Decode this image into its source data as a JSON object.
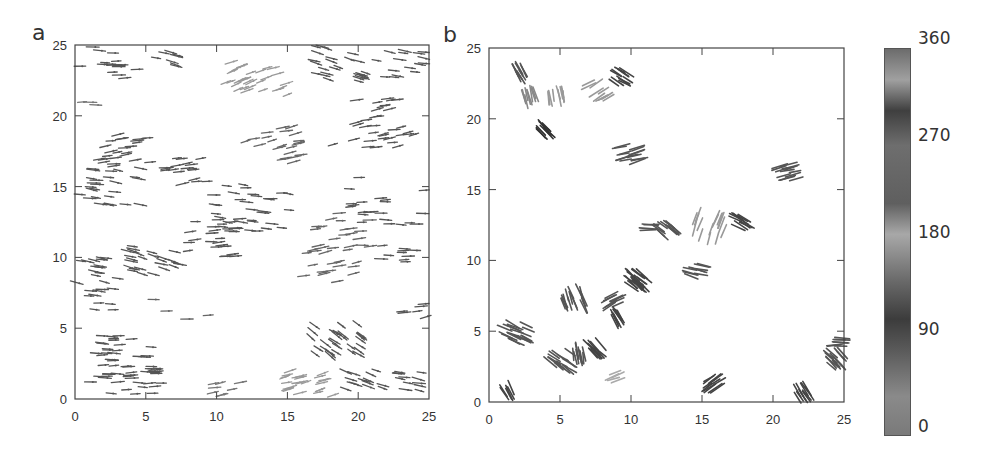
{
  "figure": {
    "panels": [
      {
        "label": "a"
      },
      {
        "label": "b"
      }
    ],
    "colorbar": {
      "ticks": [
        "360",
        "270",
        "180",
        "90",
        "0"
      ],
      "tick_values": [
        360,
        270,
        180,
        90,
        0
      ],
      "gradient_stops": [
        {
          "pos": 0.0,
          "color": "#7a7a7a"
        },
        {
          "pos": 0.1,
          "color": "#8a8a8a"
        },
        {
          "pos": 0.22,
          "color": "#5a5a5a"
        },
        {
          "pos": 0.3,
          "color": "#3c3c3c"
        },
        {
          "pos": 0.4,
          "color": "#6a6a6a"
        },
        {
          "pos": 0.52,
          "color": "#a8a8a8"
        },
        {
          "pos": 0.6,
          "color": "#5f5f5f"
        },
        {
          "pos": 0.75,
          "color": "#6e6e6e"
        },
        {
          "pos": 0.84,
          "color": "#3f3f3f"
        },
        {
          "pos": 0.92,
          "color": "#a0a0a0"
        },
        {
          "pos": 1.0,
          "color": "#6c6c6c"
        }
      ]
    }
  },
  "chart_data": [
    {
      "type": "scatter",
      "title": "a",
      "subtype": "vector field (particle orientations, short arrows)",
      "xlabel": "",
      "ylabel": "",
      "xlim": [
        0,
        25
      ],
      "ylim": [
        0,
        25
      ],
      "xticks": [
        "0",
        "5",
        "10",
        "15",
        "20",
        "25"
      ],
      "yticks": [
        "0",
        "5",
        "10",
        "15",
        "20",
        "25"
      ],
      "grid": false,
      "description": "Dense, mostly horizontal arrows spread across domain; light-grey tilted cluster near (13,23) and (17,1); tilted dark cluster near (18,4).",
      "clusters": [
        {
          "x": 1.5,
          "y": 24.2,
          "n": 6,
          "angle": 0,
          "spread": 1.2,
          "color": "#555"
        },
        {
          "x": 3.2,
          "y": 23.2,
          "n": 10,
          "angle": 0,
          "spread": 1.3,
          "color": "#555"
        },
        {
          "x": 6.5,
          "y": 24.0,
          "n": 8,
          "angle": -15,
          "spread": 1.0,
          "color": "#555"
        },
        {
          "x": 12.8,
          "y": 22.8,
          "n": 30,
          "angle": 20,
          "spread": 2.2,
          "color": "#999"
        },
        {
          "x": 18.5,
          "y": 23.8,
          "n": 26,
          "angle": -18,
          "spread": 2.3,
          "color": "#555"
        },
        {
          "x": 23.0,
          "y": 23.8,
          "n": 16,
          "angle": -10,
          "spread": 1.8,
          "color": "#555"
        },
        {
          "x": 1.0,
          "y": 21.0,
          "n": 3,
          "angle": 0,
          "spread": 0.5,
          "color": "#777"
        },
        {
          "x": 21.0,
          "y": 19.5,
          "n": 34,
          "angle": 10,
          "spread": 3.0,
          "color": "#555"
        },
        {
          "x": 14.0,
          "y": 18.0,
          "n": 22,
          "angle": 12,
          "spread": 2.2,
          "color": "#666"
        },
        {
          "x": 3.5,
          "y": 17.5,
          "n": 24,
          "angle": 8,
          "spread": 2.0,
          "color": "#555"
        },
        {
          "x": 8.0,
          "y": 16.0,
          "n": 18,
          "angle": 8,
          "spread": 1.7,
          "color": "#555"
        },
        {
          "x": 2.5,
          "y": 15.0,
          "n": 26,
          "angle": -8,
          "spread": 2.2,
          "color": "#555"
        },
        {
          "x": 12.5,
          "y": 13.5,
          "n": 36,
          "angle": -5,
          "spread": 2.8,
          "color": "#555"
        },
        {
          "x": 22.0,
          "y": 14.0,
          "n": 22,
          "angle": 0,
          "spread": 3.0,
          "color": "#555"
        },
        {
          "x": 19.0,
          "y": 12.0,
          "n": 18,
          "angle": 5,
          "spread": 2.2,
          "color": "#666"
        },
        {
          "x": 9.5,
          "y": 11.5,
          "n": 22,
          "angle": 5,
          "spread": 2.4,
          "color": "#555"
        },
        {
          "x": 5.5,
          "y": 10.0,
          "n": 26,
          "angle": -15,
          "spread": 2.0,
          "color": "#555"
        },
        {
          "x": 1.5,
          "y": 9.0,
          "n": 16,
          "angle": -10,
          "spread": 1.6,
          "color": "#555"
        },
        {
          "x": 18.0,
          "y": 9.5,
          "n": 20,
          "angle": 10,
          "spread": 2.0,
          "color": "#666"
        },
        {
          "x": 23.0,
          "y": 10.0,
          "n": 10,
          "angle": 0,
          "spread": 1.4,
          "color": "#555"
        },
        {
          "x": 2.0,
          "y": 7.0,
          "n": 10,
          "angle": -5,
          "spread": 1.4,
          "color": "#555"
        },
        {
          "x": 18.5,
          "y": 4.2,
          "n": 30,
          "angle": -35,
          "spread": 2.0,
          "color": "#555"
        },
        {
          "x": 4.0,
          "y": 3.0,
          "n": 36,
          "angle": 0,
          "spread": 2.6,
          "color": "#555"
        },
        {
          "x": 3.5,
          "y": 0.8,
          "n": 34,
          "angle": 0,
          "spread": 2.8,
          "color": "#555"
        },
        {
          "x": 10.5,
          "y": 0.6,
          "n": 10,
          "angle": 10,
          "spread": 1.2,
          "color": "#777"
        },
        {
          "x": 16.5,
          "y": 1.0,
          "n": 28,
          "angle": 15,
          "spread": 1.8,
          "color": "#999"
        },
        {
          "x": 20.5,
          "y": 1.2,
          "n": 14,
          "angle": -20,
          "spread": 1.4,
          "color": "#555"
        },
        {
          "x": 23.8,
          "y": 1.2,
          "n": 12,
          "angle": -10,
          "spread": 1.2,
          "color": "#555"
        },
        {
          "x": 7.5,
          "y": 6.5,
          "n": 4,
          "angle": 0,
          "spread": 2.0,
          "color": "#666"
        },
        {
          "x": 24.2,
          "y": 6.0,
          "n": 8,
          "angle": 10,
          "spread": 1.2,
          "color": "#555"
        }
      ]
    },
    {
      "type": "scatter",
      "title": "b",
      "subtype": "vector field (particle orientations, clustered arrows)",
      "xlabel": "",
      "ylabel": "",
      "xlim": [
        0,
        25
      ],
      "ylim": [
        0,
        25
      ],
      "xticks": [
        "0",
        "5",
        "10",
        "15",
        "20",
        "25"
      ],
      "yticks": [
        "0",
        "5",
        "10",
        "15",
        "20",
        "25"
      ],
      "grid": false,
      "description": "Particles aggregated into compact oriented clusters along a diagonal band from lower-left to upper-right.",
      "clusters": [
        {
          "x": 2.2,
          "y": 23.2,
          "n": 10,
          "angle": -60,
          "spread": 0.5,
          "color": "#555"
        },
        {
          "x": 2.9,
          "y": 21.5,
          "n": 10,
          "angle": -75,
          "spread": 0.5,
          "color": "#888"
        },
        {
          "x": 4.7,
          "y": 21.7,
          "n": 10,
          "angle": -80,
          "spread": 0.6,
          "color": "#999"
        },
        {
          "x": 7.7,
          "y": 22.0,
          "n": 10,
          "angle": 30,
          "spread": 0.8,
          "color": "#999"
        },
        {
          "x": 9.3,
          "y": 23.0,
          "n": 12,
          "angle": -30,
          "spread": 0.6,
          "color": "#444"
        },
        {
          "x": 4.0,
          "y": 19.2,
          "n": 10,
          "angle": -45,
          "spread": 0.4,
          "color": "#333"
        },
        {
          "x": 9.8,
          "y": 17.6,
          "n": 16,
          "angle": 15,
          "spread": 0.8,
          "color": "#555"
        },
        {
          "x": 21.0,
          "y": 16.3,
          "n": 14,
          "angle": 15,
          "spread": 0.7,
          "color": "#555"
        },
        {
          "x": 11.3,
          "y": 12.3,
          "n": 4,
          "angle": 0,
          "spread": 0.3,
          "color": "#555"
        },
        {
          "x": 12.5,
          "y": 12.2,
          "n": 14,
          "angle": -40,
          "spread": 0.6,
          "color": "#555"
        },
        {
          "x": 15.5,
          "y": 12.3,
          "n": 16,
          "angle": 70,
          "spread": 1.2,
          "color": "#999"
        },
        {
          "x": 17.7,
          "y": 12.7,
          "n": 12,
          "angle": -30,
          "spread": 0.6,
          "color": "#444"
        },
        {
          "x": 14.5,
          "y": 9.2,
          "n": 10,
          "angle": -15,
          "spread": 0.7,
          "color": "#555"
        },
        {
          "x": 10.4,
          "y": 8.6,
          "n": 22,
          "angle": -40,
          "spread": 0.7,
          "color": "#444"
        },
        {
          "x": 8.5,
          "y": 7.2,
          "n": 10,
          "angle": 30,
          "spread": 0.6,
          "color": "#555"
        },
        {
          "x": 9.0,
          "y": 5.9,
          "n": 10,
          "angle": -60,
          "spread": 0.4,
          "color": "#444"
        },
        {
          "x": 6.0,
          "y": 7.3,
          "n": 16,
          "angle": -70,
          "spread": 0.8,
          "color": "#555"
        },
        {
          "x": 2.0,
          "y": 4.8,
          "n": 20,
          "angle": -25,
          "spread": 0.9,
          "color": "#555"
        },
        {
          "x": 5.0,
          "y": 2.9,
          "n": 16,
          "angle": -35,
          "spread": 0.8,
          "color": "#555"
        },
        {
          "x": 6.2,
          "y": 3.4,
          "n": 10,
          "angle": -80,
          "spread": 0.5,
          "color": "#555"
        },
        {
          "x": 7.4,
          "y": 3.7,
          "n": 12,
          "angle": -45,
          "spread": 0.5,
          "color": "#444"
        },
        {
          "x": 8.8,
          "y": 1.8,
          "n": 5,
          "angle": 20,
          "spread": 0.4,
          "color": "#aaa"
        },
        {
          "x": 1.3,
          "y": 0.8,
          "n": 6,
          "angle": -60,
          "spread": 0.3,
          "color": "#444"
        },
        {
          "x": 15.8,
          "y": 1.4,
          "n": 12,
          "angle": 35,
          "spread": 0.6,
          "color": "#444"
        },
        {
          "x": 22.2,
          "y": 0.7,
          "n": 12,
          "angle": -55,
          "spread": 0.5,
          "color": "#444"
        },
        {
          "x": 24.3,
          "y": 3.0,
          "n": 14,
          "angle": -45,
          "spread": 0.6,
          "color": "#555"
        },
        {
          "x": 24.6,
          "y": 4.2,
          "n": 8,
          "angle": 0,
          "spread": 0.4,
          "color": "#555"
        }
      ]
    },
    {
      "type": "heatmap",
      "title": "colorbar",
      "description": "Cyclic grayscale colorbar for orientation angle (degrees)",
      "range": [
        0,
        360
      ],
      "ticks": [
        0,
        90,
        180,
        270,
        360
      ]
    }
  ]
}
